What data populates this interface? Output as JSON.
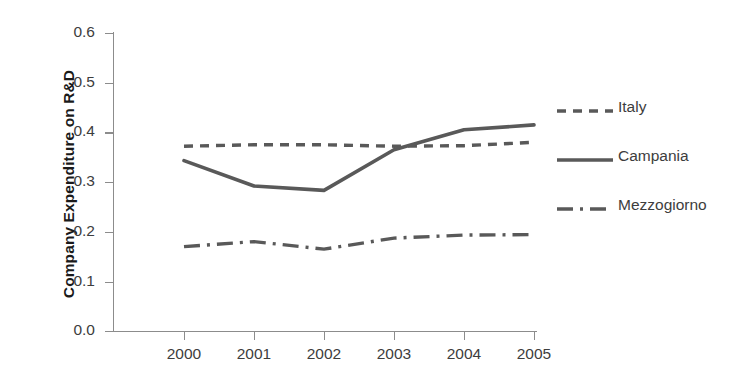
{
  "chart_data": {
    "type": "line",
    "title": "",
    "xlabel": "",
    "ylabel": "Company Expenditure on R&D",
    "categories": [
      "2000",
      "2001",
      "2002",
      "2003",
      "2004",
      "2005"
    ],
    "x": [
      2000,
      2001,
      2002,
      2003,
      2004,
      2005
    ],
    "ylim": [
      0.0,
      0.6
    ],
    "yticks": [
      "0.0",
      "0.1",
      "0.2",
      "0.3",
      "0.4",
      "0.5",
      "0.6"
    ],
    "grid": false,
    "legend_position": "right",
    "series": [
      {
        "name": "Italy",
        "style": "dashed",
        "color": "#595959",
        "values": [
          0.372,
          0.375,
          0.375,
          0.372,
          0.373,
          0.38
        ]
      },
      {
        "name": "Campania",
        "style": "solid",
        "color": "#595959",
        "values": [
          0.343,
          0.292,
          0.283,
          0.365,
          0.405,
          0.415
        ]
      },
      {
        "name": "Mezzogiorno",
        "style": "dash-dot",
        "color": "#595959",
        "values": [
          0.17,
          0.18,
          0.165,
          0.187,
          0.193,
          0.194
        ]
      }
    ]
  },
  "axes": {
    "y_title": "Company Expenditure on R&D",
    "y_tick_labels": [
      "0.6",
      "0.5",
      "0.4",
      "0.3",
      "0.2",
      "0.1",
      "0.0"
    ],
    "x_tick_labels": [
      "2000",
      "2001",
      "2002",
      "2003",
      "2004",
      "2005"
    ]
  },
  "legend": {
    "entries": [
      {
        "label": "Italy"
      },
      {
        "label": "Campania"
      },
      {
        "label": "Mezzogiorno"
      }
    ]
  },
  "colors": {
    "series_line": "#595959",
    "axis": "#8c8c8c",
    "tick_text": "#3d3d3d",
    "title_text": "#1a1a1a",
    "background": "#ffffff"
  }
}
